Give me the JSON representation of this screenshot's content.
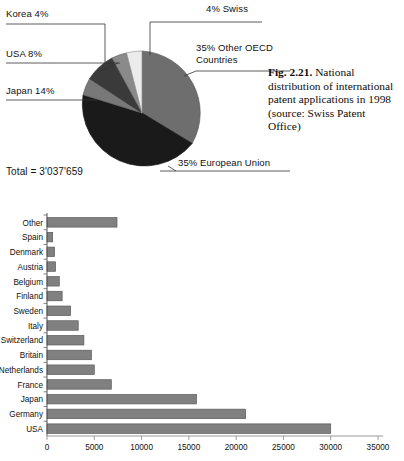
{
  "figure": {
    "caption_number": "Fig. 2.21.",
    "caption_text": " National distribution of international patent applications in 1998 (source: Swiss Patent Office)"
  },
  "pie": {
    "total_label": "Total  =  3'037'659",
    "labels": {
      "korea": "Korea 4%",
      "usa": "USA 8%",
      "japan": "Japan 14%",
      "swiss": "4% Swiss",
      "oecd": "35% Other OECD\nCountries",
      "eu": "35% European Union"
    }
  },
  "chart_data": [
    {
      "type": "pie",
      "title": "National distribution of international patent applications in 1998",
      "total": 3037659,
      "total_text": "Total  =  3'037'659",
      "legend_position": "callout-labels",
      "slices": [
        {
          "label": "Other OECD Countries",
          "value": 35,
          "display": "35% Other OECD Countries",
          "color": "#6e6e6e"
        },
        {
          "label": "European Union",
          "value": 35,
          "display": "35% European Union",
          "color": "#1a1a1a"
        },
        {
          "label": "Japan",
          "value": 14,
          "display": "Japan 14%",
          "color": "#787878"
        },
        {
          "label": "USA",
          "value": 8,
          "display": "USA 8%",
          "color": "#3a3a3a"
        },
        {
          "label": "Korea",
          "value": 4,
          "display": "Korea 4%",
          "color": "#8a8a8a"
        },
        {
          "label": "Swiss",
          "value": 4,
          "display": "4% Swiss",
          "color": "#e8e8e8"
        }
      ]
    },
    {
      "type": "bar",
      "orientation": "horizontal",
      "title": "",
      "xlabel": "",
      "ylabel": "",
      "xlim": [
        0,
        35000
      ],
      "xticks": [
        0,
        5000,
        10000,
        15000,
        20000,
        25000,
        30000,
        35000
      ],
      "xtick_labels": [
        "0",
        "5000",
        "10000",
        "15000",
        "20000",
        "25000",
        "30000",
        "35000"
      ],
      "grid": false,
      "bar_color": "#808080",
      "categories": [
        "Other",
        "Spain",
        "Denmark",
        "Austria",
        "Belgium",
        "Finland",
        "Sweden",
        "Italy",
        "Switzerland",
        "Britain",
        "Netherlands",
        "France",
        "Japan",
        "Germany",
        "USA"
      ],
      "values": [
        7400,
        600,
        800,
        900,
        1300,
        1600,
        2500,
        3300,
        3900,
        4700,
        5000,
        6800,
        15800,
        21000,
        30000
      ]
    }
  ]
}
